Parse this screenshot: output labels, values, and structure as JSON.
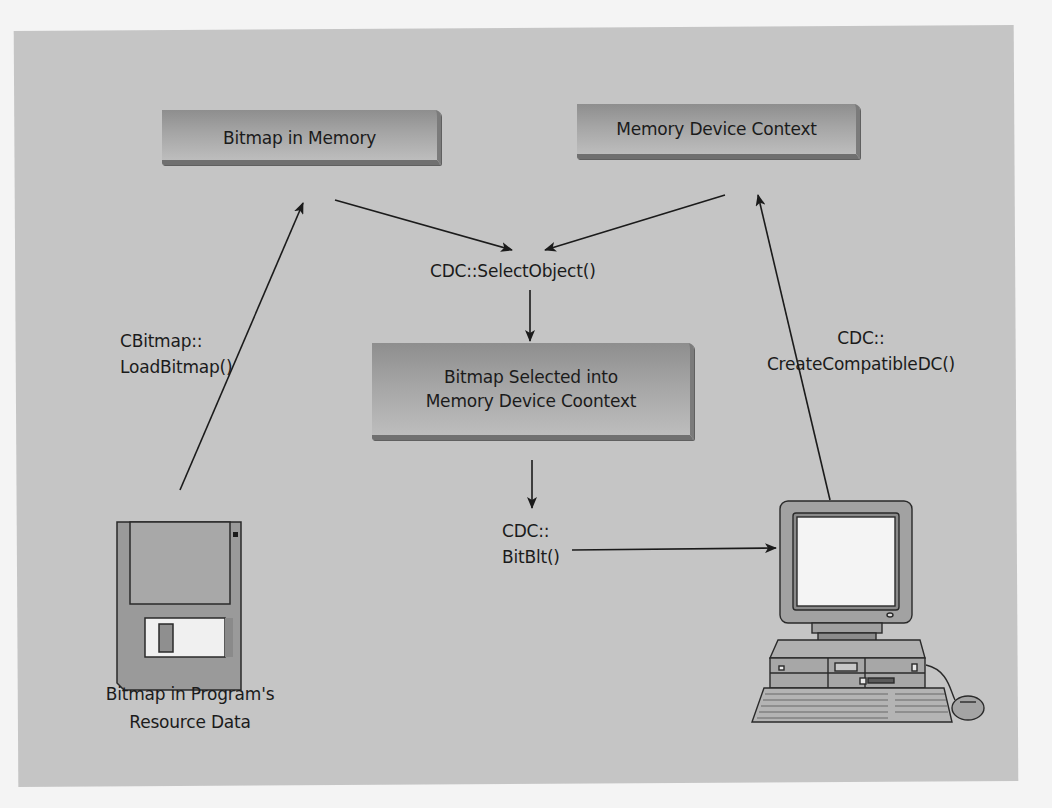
{
  "diagram": {
    "title": "",
    "nodes": {
      "bitmap_in_memory": {
        "label": "Bitmap in Memory"
      },
      "memory_dc": {
        "label": "Memory Device Context"
      },
      "bitmap_selected": {
        "line1": "Bitmap Selected into",
        "line2": "Memory Device Coontext"
      },
      "floppy_disk": {
        "line1": "Bitmap in Program's",
        "line2": "Resource Data",
        "icon": "floppy-disk-icon"
      },
      "computer": {
        "icon": "desktop-computer-icon"
      }
    },
    "edge_labels": {
      "select_object": "CDC::SelectObject()",
      "load_bitmap_1": "CBitmap::",
      "load_bitmap_2": "LoadBitmap()",
      "create_dc_1": "CDC::",
      "create_dc_2": "CreateCompatibleDC()",
      "bitblt_1": "CDC::",
      "bitblt_2": "BitBlt()"
    },
    "edges": [
      {
        "from": "floppy_disk",
        "to": "bitmap_in_memory",
        "label": "CBitmap::LoadBitmap()"
      },
      {
        "from": "computer",
        "to": "memory_dc",
        "label": "CDC::CreateCompatibleDC()"
      },
      {
        "from": "bitmap_in_memory",
        "to": "select_object",
        "label": ""
      },
      {
        "from": "memory_dc",
        "to": "select_object",
        "label": ""
      },
      {
        "from": "select_object",
        "to": "bitmap_selected",
        "label": "CDC::SelectObject()"
      },
      {
        "from": "bitmap_selected",
        "to": "bitblt",
        "label": ""
      },
      {
        "from": "bitblt",
        "to": "computer",
        "label": "CDC::BitBlt()"
      }
    ],
    "colors": {
      "panel_background": "#c5c5c5",
      "page_background": "#f4f4f4",
      "box_fill": "#a5a5a5",
      "box_shadow": "#707070",
      "line": "#1b1b1b"
    }
  }
}
